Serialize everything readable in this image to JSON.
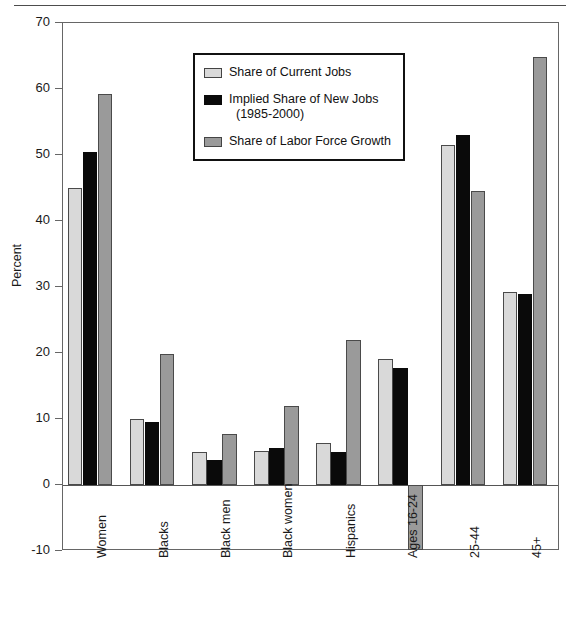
{
  "chart_data": {
    "type": "bar",
    "title": "",
    "xlabel": "",
    "ylabel": "Percent",
    "ylim": [
      -10,
      70
    ],
    "yticks": [
      -10,
      0,
      10,
      20,
      30,
      40,
      50,
      60,
      70
    ],
    "ytick_labels": [
      "-10",
      "0",
      "10",
      "20",
      "30",
      "40",
      "50",
      "60",
      "70"
    ],
    "grid": false,
    "legend_position": "upper center",
    "categories": [
      "Women",
      "Blacks",
      "Black men",
      "Black women",
      "Hispanics",
      "Ages 16-24",
      "25-44",
      "45+"
    ],
    "series": [
      {
        "name": "Share of Current Jobs",
        "color": "#d9d9d9",
        "values": [
          45.0,
          10.0,
          5.0,
          5.2,
          6.4,
          19.1,
          51.5,
          29.2
        ]
      },
      {
        "name": "Implied Share of New Jobs (1985-2000)",
        "color": "#0a0a0a",
        "values": [
          50.5,
          9.5,
          3.8,
          5.6,
          5.0,
          17.8,
          53.0,
          29.0
        ]
      },
      {
        "name": "Share of Labor Force Growth",
        "color": "#9a9a9a",
        "values": [
          59.3,
          19.8,
          7.7,
          12.0,
          22.0,
          -9.8,
          44.6,
          64.8
        ]
      }
    ]
  },
  "legend": {
    "entries": [
      {
        "label": "Share of Current Jobs",
        "label_line2": ""
      },
      {
        "label": "Implied Share of New Jobs",
        "label_line2": "(1985-2000)"
      },
      {
        "label": "Share of Labor Force Growth",
        "label_line2": ""
      }
    ]
  }
}
